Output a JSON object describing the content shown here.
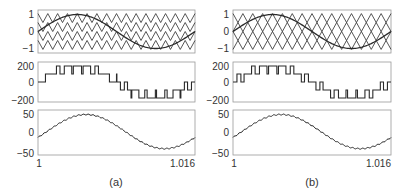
{
  "chart_data": [
    {
      "panel": "a",
      "caption": "(a)",
      "subplots": [
        {
          "type": "line",
          "title": "",
          "yticks": [
            "1",
            "0",
            "−1"
          ],
          "ylim": [
            -1.2,
            1.2
          ],
          "series": [
            {
              "name": "reference sine",
              "shape": "sine",
              "amplitude": 0.95,
              "cycles": 1
            },
            {
              "name": "carrier 1",
              "shape": "triangle",
              "range": [
                0.5,
                1.0
              ],
              "cycles": 16,
              "phase": 0
            },
            {
              "name": "carrier 2",
              "shape": "triangle",
              "range": [
                0.0,
                0.5
              ],
              "cycles": 16,
              "phase": 0
            },
            {
              "name": "carrier 3",
              "shape": "triangle",
              "range": [
                -0.5,
                0.0
              ],
              "cycles": 16,
              "phase": 0
            },
            {
              "name": "carrier 4",
              "shape": "triangle",
              "range": [
                -1.0,
                -0.5
              ],
              "cycles": 16,
              "phase": 0
            }
          ],
          "grid": false
        },
        {
          "type": "line",
          "yticks": [
            "200",
            "0",
            "−200"
          ],
          "ylim": [
            -250,
            250
          ],
          "series": [
            {
              "name": "output voltage",
              "shape": "staircase",
              "levels": [
                -200,
                -100,
                0,
                100,
                200
              ]
            }
          ]
        },
        {
          "type": "line",
          "yticks": [
            "50",
            "0",
            "−50"
          ],
          "ylim": [
            -50,
            50
          ],
          "series": [
            {
              "name": "current",
              "shape": "sine",
              "amplitude": 38,
              "offset": 2
            }
          ]
        }
      ],
      "xticks": [
        "1",
        "1.016"
      ],
      "xlim": [
        1,
        1.016
      ]
    },
    {
      "panel": "b",
      "caption": "(b)",
      "subplots": [
        {
          "type": "line",
          "yticks": [
            "1",
            "0",
            "−1"
          ],
          "ylim": [
            -1.2,
            1.2
          ],
          "series": [
            {
              "name": "reference sine",
              "shape": "sine",
              "amplitude": 0.95,
              "cycles": 1
            },
            {
              "name": "carrier 1",
              "shape": "triangle",
              "range": [
                0.5,
                1.0
              ],
              "cycles": 16,
              "phase": 0
            },
            {
              "name": "carrier 2",
              "shape": "triangle",
              "range": [
                0.0,
                0.5
              ],
              "cycles": 16,
              "phase": 180
            },
            {
              "name": "carrier 3",
              "shape": "triangle",
              "range": [
                -0.5,
                0.0
              ],
              "cycles": 16,
              "phase": 0
            },
            {
              "name": "carrier 4",
              "shape": "triangle",
              "range": [
                -1.0,
                -0.5
              ],
              "cycles": 16,
              "phase": 180
            }
          ]
        },
        {
          "type": "line",
          "yticks": [
            "200",
            "0",
            "−200"
          ],
          "ylim": [
            -250,
            250
          ],
          "series": [
            {
              "name": "output voltage",
              "shape": "staircase",
              "levels": [
                -200,
                -100,
                0,
                100,
                200
              ]
            }
          ]
        },
        {
          "type": "line",
          "yticks": [
            "50",
            "0",
            "−50"
          ],
          "ylim": [
            -50,
            50
          ],
          "series": [
            {
              "name": "current",
              "shape": "sine",
              "amplitude": 38,
              "offset": 2
            }
          ]
        }
      ],
      "xticks": [
        "1",
        "1.016"
      ],
      "xlim": [
        1,
        1.016
      ]
    }
  ],
  "labels": {
    "a": {
      "top_ticks": [
        "1",
        "0",
        "−1"
      ],
      "mid_ticks": [
        "200",
        "0",
        "−200"
      ],
      "bot_ticks": [
        "50",
        "0",
        "−50"
      ],
      "x_start": "1",
      "x_end": "1.016",
      "caption": "(a)"
    },
    "b": {
      "top_ticks": [
        "1",
        "0",
        "−1"
      ],
      "mid_ticks": [
        "200",
        "0",
        "−200"
      ],
      "bot_ticks": [
        "50",
        "0",
        "−50"
      ],
      "x_start": "1",
      "x_end": "1.016",
      "caption": "(b)"
    }
  },
  "colors": {
    "line": "#2a2a2a",
    "frame": "#999999"
  }
}
